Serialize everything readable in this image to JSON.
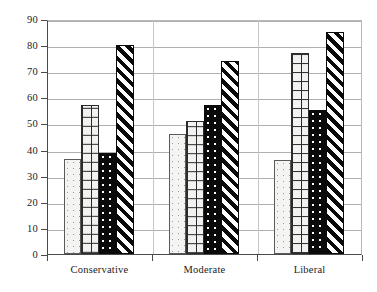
{
  "chart_data": {
    "type": "bar",
    "title": "",
    "subtitle": "",
    "xlabel": "",
    "ylabel": "",
    "categories": [
      "Conservative",
      "Moderate",
      "Liberal"
    ],
    "series": [
      {
        "name": "Series 1",
        "pattern": "light-stipple",
        "values": [
          36.5,
          46,
          36
        ]
      },
      {
        "name": "Series 2",
        "pattern": "crosshatch-grid",
        "values": [
          57,
          51,
          77
        ]
      },
      {
        "name": "Series 3",
        "pattern": "black-dotted",
        "values": [
          38.5,
          57,
          55
        ]
      },
      {
        "name": "Series 4",
        "pattern": "diagonal-stripe",
        "values": [
          80,
          74,
          85
        ]
      }
    ],
    "ylim": [
      0,
      90
    ],
    "ytick_labels": [
      "0",
      "10",
      "20",
      "30",
      "40",
      "50",
      "60",
      "70",
      "80",
      "90"
    ],
    "ytick_values": [
      0,
      10,
      20,
      30,
      40,
      50,
      60,
      70,
      80,
      90
    ],
    "grid": true,
    "grid_axis": "y",
    "legend": false,
    "legend_position": "none",
    "bar_edge_color": "#2b2b2b",
    "axis_color": "#4a4a4a",
    "grid_color": "#b0b0b0",
    "background": "#ffffff"
  }
}
